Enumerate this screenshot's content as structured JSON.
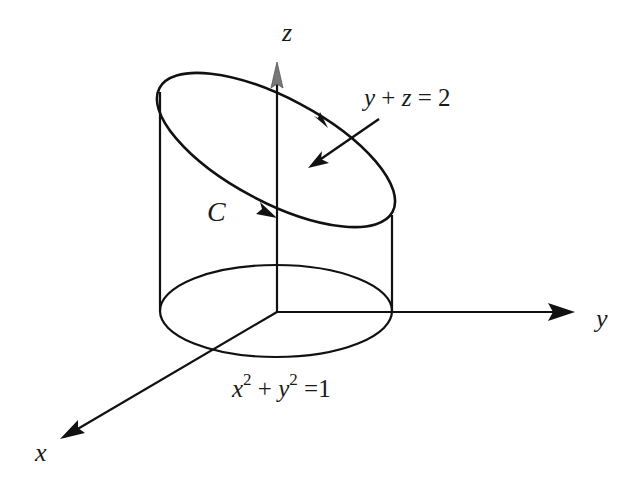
{
  "figure": {
    "axes": {
      "x_label": "x",
      "y_label": "y",
      "z_label": "z"
    },
    "labels": {
      "plane": {
        "var1": "y",
        "op1": "+",
        "var2": "z",
        "eq": "=",
        "rhs": "2"
      },
      "curve": "C",
      "cylinder": {
        "var1": "x",
        "exp1": "2",
        "op1": "+",
        "var2": "y",
        "exp2": "2",
        "eq": "=",
        "rhs": "1"
      }
    },
    "colors": {
      "stroke": "#111111",
      "z_arrowhead": "#777777",
      "background": "#ffffff"
    }
  }
}
